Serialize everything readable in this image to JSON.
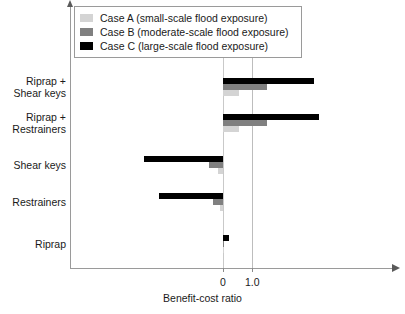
{
  "chart_data": {
    "type": "bar",
    "orientation": "horizontal",
    "title": "",
    "xlabel": "Benefit-cost ratio",
    "ylabel": "",
    "xlim": [
      -3.4,
      4.2
    ],
    "xticks": [
      0,
      1.0
    ],
    "xticklabels": [
      "0",
      "1.0"
    ],
    "grid": true,
    "gridlines_at": [
      0,
      1.0
    ],
    "legend_position": "top-left",
    "categories": [
      "Riprap +\nShear keys",
      "Riprap +\nRestrainers",
      "Shear keys",
      "Restrainers",
      "Riprap"
    ],
    "series": [
      {
        "name": "Case A (small-scale flood exposure)",
        "short_name": "Case A",
        "color": "#d4d4d4",
        "values": [
          0.55,
          0.55,
          -0.17,
          -0.1,
          0.02
        ]
      },
      {
        "name": "Case B (moderate-scale flood exposure)",
        "short_name": "Case B",
        "color": "#808080",
        "values": [
          1.5,
          1.5,
          -0.47,
          -0.33,
          0.05
        ]
      },
      {
        "name": "Case C (large-scale flood exposure)",
        "short_name": "Case C",
        "color": "#000000",
        "values": [
          3.1,
          3.3,
          -2.7,
          -2.2,
          0.22
        ]
      }
    ]
  },
  "legend": {
    "items": [
      {
        "label": "Case A (small-scale flood exposure)",
        "color": "#d4d4d4"
      },
      {
        "label": "Case B (moderate-scale flood exposure)",
        "color": "#808080"
      },
      {
        "label": "Case C (large-scale flood exposure)",
        "color": "#000000"
      }
    ]
  },
  "axis": {
    "x_title": "Benefit-cost ratio",
    "tick_0": "0",
    "tick_1": "1.0"
  }
}
